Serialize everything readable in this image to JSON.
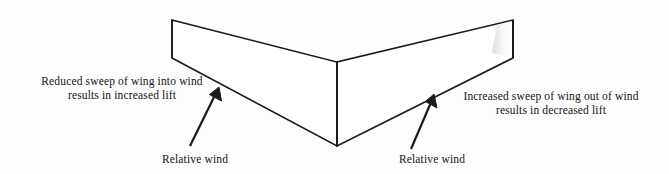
{
  "figure": {
    "type": "diagram",
    "background_color": "#fdfdfd",
    "line_color": "#1a1a1a",
    "text_color": "#141414"
  },
  "callouts": {
    "left": {
      "line1": "Reduced sweep of wing into wind",
      "line2": "results in increased lift"
    },
    "right": {
      "line1": "Increased sweep of wing out of wind",
      "line2": "results in decreased lift"
    }
  },
  "wind_labels": {
    "left": "Relative wind",
    "right": "Relative wind"
  },
  "geometry": {
    "left_tip_top": [
      172,
      20
    ],
    "left_tip_bottom": [
      172,
      58
    ],
    "center_top": [
      337,
      62
    ],
    "center_bottom": [
      337,
      146
    ],
    "right_tip_top": [
      513,
      20
    ],
    "right_tip_bottom": [
      513,
      58
    ],
    "arrow_left": {
      "tail": [
        190,
        146
      ],
      "tip": [
        219,
        88
      ]
    },
    "arrow_right": {
      "tail": [
        411,
        149
      ],
      "tip": [
        434,
        95
      ]
    }
  }
}
